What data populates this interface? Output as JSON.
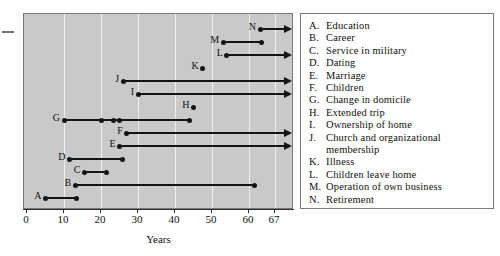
{
  "chart_data": {
    "type": "bar",
    "orientation": "horizontal",
    "title": "",
    "xlabel": "Years",
    "ylabel": "",
    "xlim": [
      0,
      72
    ],
    "xticks": [
      0,
      10,
      20,
      30,
      40,
      50,
      60,
      67
    ],
    "xticklabels": [
      "0",
      "10",
      "20",
      "30",
      "40",
      "50",
      "60",
      "67"
    ],
    "grid": "vertical",
    "legend_position": "right",
    "series": [
      {
        "key": "N",
        "label": "Retirement",
        "start": 63,
        "end": 72,
        "open_ended": true,
        "dots": [
          63
        ]
      },
      {
        "key": "M",
        "label": "Operation of own business",
        "start": 53,
        "end": 63.5,
        "open_ended": false,
        "dots": [
          53,
          63.5
        ]
      },
      {
        "key": "L",
        "label": "Children leave home",
        "start": 54,
        "end": 72,
        "open_ended": true,
        "dots": [
          54
        ]
      },
      {
        "key": "K",
        "label": "Illness",
        "start": 47.5,
        "end": 47.5,
        "open_ended": false,
        "dots": [
          47.5
        ]
      },
      {
        "key": "J",
        "label": "Church and organizational membership",
        "start": 26,
        "end": 72,
        "open_ended": true,
        "dots": [
          26
        ]
      },
      {
        "key": "I",
        "label": "Ownership of home",
        "start": 30,
        "end": 72,
        "open_ended": true,
        "dots": [
          30
        ]
      },
      {
        "key": "H",
        "label": "Extended trip",
        "start": 45,
        "end": 45,
        "open_ended": false,
        "dots": [
          45
        ]
      },
      {
        "key": "G",
        "label": "Change in domicile",
        "start": 10,
        "end": 44,
        "open_ended": false,
        "dots": [
          10,
          20,
          23.5,
          25,
          44
        ]
      },
      {
        "key": "F",
        "label": "Children",
        "start": 27,
        "end": 72,
        "open_ended": true,
        "dots": [
          27
        ]
      },
      {
        "key": "E",
        "label": "Marriage",
        "start": 25,
        "end": 72,
        "open_ended": true,
        "dots": [
          25
        ]
      },
      {
        "key": "D",
        "label": "Dating",
        "start": 11.5,
        "end": 25.7,
        "open_ended": false,
        "dots": [
          11.5,
          25.7
        ]
      },
      {
        "key": "C",
        "label": "Service in military",
        "start": 15.5,
        "end": 21.5,
        "open_ended": false,
        "dots": [
          15.5,
          21.5
        ]
      },
      {
        "key": "B",
        "label": "Career",
        "start": 13,
        "end": 61.5,
        "open_ended": false,
        "dots": [
          13,
          61.5
        ]
      },
      {
        "key": "A",
        "label": "Education",
        "start": 5,
        "end": 13.5,
        "open_ended": false,
        "dots": [
          5,
          13.5
        ]
      }
    ]
  },
  "axis": {
    "title": "Years",
    "ticks": [
      {
        "value": 0,
        "label": "0"
      },
      {
        "value": 10,
        "label": "10"
      },
      {
        "value": 20,
        "label": "20"
      },
      {
        "value": 30,
        "label": "30"
      },
      {
        "value": 40,
        "label": "40"
      },
      {
        "value": 50,
        "label": "50"
      },
      {
        "value": 60,
        "label": "60"
      },
      {
        "value": 67,
        "label": "67"
      }
    ]
  },
  "legend": {
    "entries": [
      {
        "key": "A.",
        "text": "Education"
      },
      {
        "key": "B.",
        "text": "Career"
      },
      {
        "key": "C.",
        "text": "Service in military"
      },
      {
        "key": "D.",
        "text": "Dating"
      },
      {
        "key": "E.",
        "text": "Marriage"
      },
      {
        "key": "F.",
        "text": "Children"
      },
      {
        "key": "G.",
        "text": "Change in domicile"
      },
      {
        "key": "H.",
        "text": "Extended trip"
      },
      {
        "key": "I.",
        "text": "Ownership of home"
      },
      {
        "key": "J.",
        "text": "Church and organizational",
        "continuation": "membership"
      },
      {
        "key": "K.",
        "text": "Illness"
      },
      {
        "key": "L.",
        "text": "Children leave home"
      },
      {
        "key": "M.",
        "text": "Operation of own business"
      },
      {
        "key": "N.",
        "text": "Retirement"
      }
    ]
  },
  "colors": {
    "plot_background": "#c9c9c9",
    "gridline": "#efefef",
    "bar": "#141414",
    "panel_border": "#7a7a7a",
    "legend_background": "#ffffff",
    "text": "#111111"
  }
}
